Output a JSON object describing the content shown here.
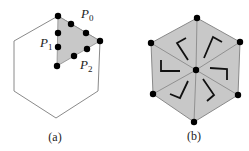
{
  "figure": {
    "panels": [
      {
        "id": "a",
        "caption": "(a)",
        "labels": {
          "p0": {
            "base": "P",
            "sub": "0"
          },
          "p1": {
            "base": "P",
            "sub": "1"
          },
          "p2": {
            "base": "P",
            "sub": "2"
          }
        },
        "description": "Outlined hexagon with one shaded triangular sector; sector edges carry dots (vertices and edge points)"
      },
      {
        "id": "b",
        "caption": "(b)",
        "description": "Hexagon split into six shaded triangles with dots at vertices and center; each triangle contains an L-shaped bracket mark arranged rotationally"
      }
    ],
    "colors": {
      "shade": "#c8c8c8",
      "outline": "#8a8a8a",
      "dot": "#000000",
      "mark": "#111111"
    }
  }
}
